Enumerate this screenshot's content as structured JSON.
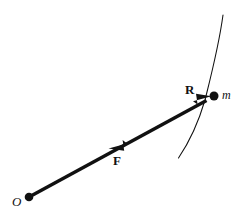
{
  "figure": {
    "background_color": "#ffffff",
    "ink_color": "#111111",
    "width": 245,
    "height": 218,
    "labels": {
      "origin": "O",
      "position_vector": "R",
      "force_vector": "F",
      "mass": "m"
    },
    "elements": {
      "origin_point": {
        "name": "origin-dot",
        "x": 29,
        "y": 197,
        "radius": 4.2
      },
      "mass_point": {
        "name": "mass-dot",
        "x": 214,
        "y": 96,
        "radius": 4.4
      },
      "position_vector_line": {
        "name": "vector-R",
        "from_x": 29,
        "from_y": 197,
        "to_x": 212,
        "to_y": 97,
        "stroke_width": 3.4,
        "arrow_at": "mass-end"
      },
      "force_arrowhead": {
        "name": "vector-F-arrowhead",
        "tip_x": 110,
        "tip_y": 146,
        "direction": "toward-origin"
      },
      "trajectory_curve": {
        "name": "trajectory-arc",
        "start_x": 223,
        "start_y": 15,
        "control_x": 205,
        "control_y": 96,
        "end_x": 178,
        "end_y": 158,
        "stroke_width": 1.0
      }
    }
  }
}
